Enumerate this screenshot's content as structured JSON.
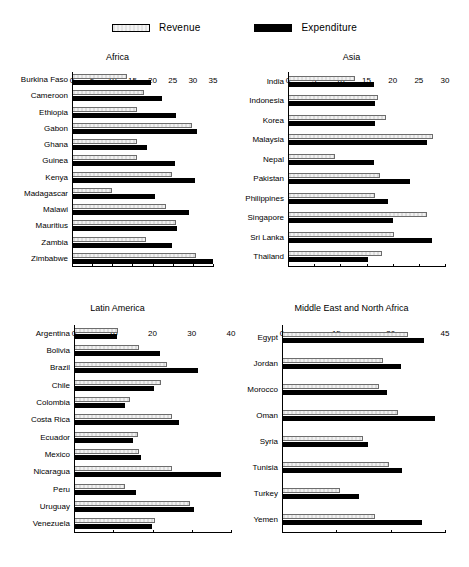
{
  "legend": {
    "items": [
      {
        "label": "Revenue",
        "icon": "light-hatched-bar-swatch",
        "color": "#e8e8e8"
      },
      {
        "label": "Expenditure",
        "icon": "black-bar-swatch",
        "color": "#000000"
      }
    ]
  },
  "chart_data": [
    {
      "type": "bar",
      "orientation": "horizontal",
      "title": "Africa",
      "xlabel": "",
      "ylabel": "",
      "xlim": [
        0,
        35
      ],
      "xticks": [
        0,
        5,
        10,
        15,
        20,
        25,
        30,
        35
      ],
      "grid": false,
      "legend_position": "top-center-shared",
      "categories": [
        "Burkina Faso",
        "Cameroon",
        "Ethiopia",
        "Gabon",
        "Ghana",
        "Guinea",
        "Kenya",
        "Madagascar",
        "Malawi",
        "Mauritius",
        "Zambia",
        "Zimbabwe"
      ],
      "series": [
        {
          "name": "Revenue",
          "values": [
            13.5,
            17.7,
            15.8,
            29.5,
            15.8,
            16.0,
            24.5,
            9.7,
            23.0,
            25.5,
            18.0,
            30.5
          ]
        },
        {
          "name": "Expenditure",
          "values": [
            19.3,
            22.2,
            25.5,
            30.8,
            18.3,
            25.3,
            30.2,
            20.3,
            28.7,
            25.8,
            24.5,
            34.8
          ]
        }
      ]
    },
    {
      "type": "bar",
      "orientation": "horizontal",
      "title": "Asia",
      "xlabel": "",
      "ylabel": "",
      "xlim": [
        0,
        30
      ],
      "xticks": [
        0,
        5,
        10,
        15,
        20,
        25,
        30
      ],
      "grid": false,
      "legend_position": "top-center-shared",
      "categories": [
        "India",
        "Indonesia",
        "Korea",
        "Malaysia",
        "Nepal",
        "Pakistan",
        "Philippines",
        "Singapore",
        "Sri Lanka",
        "Thailand"
      ],
      "series": [
        {
          "name": "Revenue",
          "values": [
            12.7,
            17.0,
            18.5,
            27.5,
            8.8,
            17.4,
            16.5,
            26.3,
            20.0,
            17.8
          ]
        },
        {
          "name": "Expenditure",
          "values": [
            16.2,
            16.5,
            16.4,
            26.3,
            16.3,
            23.2,
            19.0,
            19.8,
            27.3,
            15.0
          ]
        }
      ]
    },
    {
      "type": "bar",
      "orientation": "horizontal",
      "title": "Latin America",
      "xlabel": "",
      "ylabel": "",
      "xlim": [
        0,
        40
      ],
      "xticks": [
        0,
        10,
        20,
        30,
        40
      ],
      "grid": false,
      "legend_position": "top-center-shared",
      "categories": [
        "Argentina",
        "Bolivia",
        "Brazil",
        "Chile",
        "Colombia",
        "Costa Rica",
        "Ecuador",
        "Mexico",
        "Nicaragua",
        "Peru",
        "Uruguay",
        "Venezuela"
      ],
      "series": [
        {
          "name": "Revenue",
          "values": [
            11.0,
            16.2,
            23.4,
            21.8,
            14.0,
            24.6,
            16.0,
            16.2,
            24.8,
            12.8,
            29.4,
            20.3
          ]
        },
        {
          "name": "Expenditure",
          "values": [
            10.8,
            21.6,
            31.4,
            20.2,
            12.8,
            26.4,
            14.8,
            16.8,
            37.2,
            15.6,
            30.2,
            19.6
          ]
        }
      ]
    },
    {
      "type": "bar",
      "orientation": "horizontal",
      "title": "Middle East and North Africa",
      "xlabel": "",
      "ylabel": "",
      "xlim": [
        0,
        45
      ],
      "xticks": [
        0,
        15,
        30,
        45
      ],
      "grid": false,
      "legend_position": "top-center-shared",
      "categories": [
        "Egypt",
        "Jordan",
        "Morocco",
        "Oman",
        "Syria",
        "Tunisia",
        "Turkey",
        "Yemen"
      ],
      "series": [
        {
          "name": "Revenue",
          "values": [
            34.5,
            27.5,
            26.5,
            31.8,
            22.0,
            29.2,
            15.8,
            25.5
          ]
        },
        {
          "name": "Expenditure",
          "values": [
            39.0,
            32.5,
            28.8,
            42.0,
            23.5,
            32.8,
            21.0,
            38.5
          ]
        }
      ]
    }
  ]
}
